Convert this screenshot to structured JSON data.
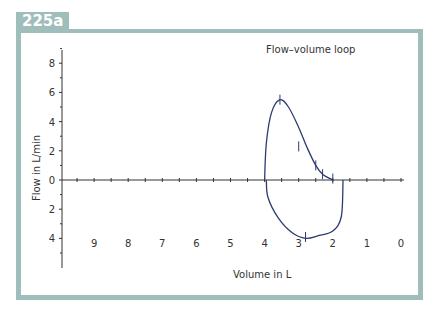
{
  "figure_label": "225a",
  "chart_data": {
    "type": "line",
    "title": "Flow–volume loop",
    "xlabel": "Volume in L",
    "ylabel": "Flow in L/min",
    "x_ticks": [
      "9",
      "8",
      "7",
      "6",
      "5",
      "4",
      "3",
      "2",
      "1",
      "0"
    ],
    "y_ticks_upper": [
      "8",
      "6",
      "4",
      "2",
      "0"
    ],
    "y_ticks_lower": [
      "2",
      "4"
    ],
    "xlim": [
      10,
      0
    ],
    "ylim": [
      -6,
      9
    ],
    "grid": false,
    "legend": null,
    "series": [
      {
        "name": "inspiratory/expiratory upper limb",
        "points": [
          [
            4.0,
            0
          ],
          [
            3.95,
            2.5
          ],
          [
            3.8,
            4.6
          ],
          [
            3.55,
            5.5
          ],
          [
            3.3,
            5.0
          ],
          [
            3.0,
            3.6
          ],
          [
            2.75,
            2.2
          ],
          [
            2.5,
            1.0
          ],
          [
            2.3,
            0.4
          ],
          [
            2.0,
            0
          ]
        ]
      },
      {
        "name": "lower limb",
        "points": [
          [
            3.95,
            0
          ],
          [
            3.9,
            -1.2
          ],
          [
            3.6,
            -2.6
          ],
          [
            3.2,
            -3.6
          ],
          [
            2.8,
            -4.0
          ],
          [
            2.4,
            -3.8
          ],
          [
            2.0,
            -3.5
          ],
          [
            1.75,
            -2.5
          ],
          [
            1.7,
            0
          ]
        ]
      }
    ],
    "markers": [
      [
        3.55,
        5.5
      ],
      [
        3.0,
        2.3
      ],
      [
        2.5,
        1.0
      ],
      [
        2.3,
        0.4
      ],
      [
        2.0,
        0.1
      ],
      [
        2.8,
        -3.9
      ]
    ]
  }
}
